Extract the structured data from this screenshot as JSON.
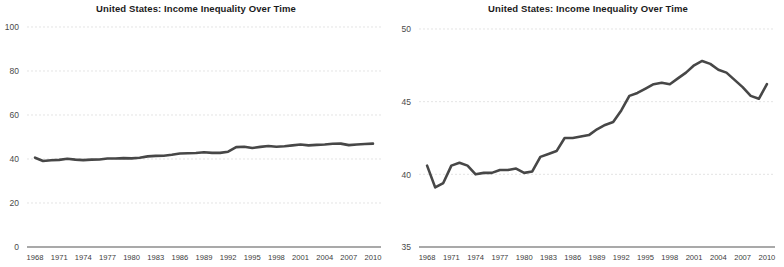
{
  "charts": [
    {
      "id": "left-chart",
      "title": "United States: Income Inequality Over Time",
      "y_ticks": [
        "0",
        "20",
        "40",
        "60",
        "80",
        "100"
      ],
      "x_ticks": [
        "1968",
        "1971",
        "1974",
        "1977",
        "1980",
        "1983",
        "1986",
        "1989",
        "1992",
        "1995",
        "1998",
        "2001",
        "2004",
        "2007",
        "2010"
      ],
      "line_color": "#474747",
      "grid_color": "#d8d8d8",
      "axis_color": "#555555"
    },
    {
      "id": "right-chart",
      "title": "United States: Income Inequality Over Time",
      "y_ticks": [
        "35",
        "40",
        "45",
        "50"
      ],
      "x_ticks": [
        "1968",
        "1971",
        "1974",
        "1977",
        "1980",
        "1983",
        "1986",
        "1989",
        "1992",
        "1995",
        "1998",
        "2001",
        "2004",
        "2007",
        "2010"
      ],
      "line_color": "#474747",
      "grid_color": "#d8d8d8",
      "axis_color": "#555555"
    }
  ],
  "chart_data": [
    {
      "type": "line",
      "title": "United States: Income Inequality Over Time",
      "xlabel": "",
      "ylabel": "",
      "ylim": [
        0,
        100
      ],
      "xlim": [
        1967,
        2011
      ],
      "yticks": [
        0,
        20,
        40,
        60,
        80,
        100
      ],
      "xticks": [
        1968,
        1971,
        1974,
        1977,
        1980,
        1983,
        1986,
        1989,
        1992,
        1995,
        1998,
        2001,
        2004,
        2007,
        2010
      ],
      "grid": true,
      "legend": "none",
      "series": [
        {
          "name": "Gini index",
          "x": [
            1968,
            1969,
            1970,
            1971,
            1972,
            1973,
            1974,
            1975,
            1976,
            1977,
            1978,
            1979,
            1980,
            1981,
            1982,
            1983,
            1984,
            1985,
            1986,
            1987,
            1988,
            1989,
            1990,
            1991,
            1992,
            1993,
            1994,
            1995,
            1996,
            1997,
            1998,
            1999,
            2000,
            2001,
            2002,
            2003,
            2004,
            2005,
            2006,
            2007,
            2008,
            2009,
            2010
          ],
          "values": [
            40.6,
            39.1,
            39.4,
            39.6,
            40.1,
            39.7,
            39.5,
            39.7,
            39.8,
            40.2,
            40.2,
            40.4,
            40.3,
            40.6,
            41.2,
            41.4,
            41.5,
            41.9,
            42.5,
            42.6,
            42.7,
            43.1,
            42.8,
            42.8,
            43.3,
            45.4,
            45.6,
            45.0,
            45.5,
            45.9,
            45.6,
            45.8,
            46.2,
            46.6,
            46.2,
            46.4,
            46.6,
            46.9,
            47.0,
            46.3,
            46.6,
            46.8,
            47.0
          ]
        }
      ]
    },
    {
      "type": "line",
      "title": "United States: Income Inequality Over Time",
      "xlabel": "",
      "ylabel": "",
      "ylim": [
        35,
        50
      ],
      "xlim": [
        1967,
        2011
      ],
      "yticks": [
        35,
        40,
        45,
        50
      ],
      "xticks": [
        1968,
        1971,
        1974,
        1977,
        1980,
        1983,
        1986,
        1989,
        1992,
        1995,
        1998,
        2001,
        2004,
        2007,
        2010
      ],
      "grid": true,
      "legend": "none",
      "series": [
        {
          "name": "Gini index",
          "x": [
            1968,
            1969,
            1970,
            1971,
            1972,
            1973,
            1974,
            1975,
            1976,
            1977,
            1978,
            1979,
            1980,
            1981,
            1982,
            1983,
            1984,
            1985,
            1986,
            1987,
            1988,
            1989,
            1990,
            1991,
            1992,
            1993,
            1994,
            1995,
            1996,
            1997,
            1998,
            1999,
            2000,
            2001,
            2002,
            2003,
            2004,
            2005,
            2006,
            2007,
            2008,
            2009,
            2010
          ],
          "values": [
            40.6,
            39.1,
            39.4,
            40.6,
            40.8,
            40.6,
            40.0,
            40.1,
            40.1,
            40.3,
            40.3,
            40.4,
            40.1,
            40.2,
            41.2,
            41.4,
            41.6,
            42.5,
            42.5,
            42.6,
            42.7,
            43.1,
            43.4,
            43.6,
            44.4,
            45.4,
            45.6,
            45.9,
            46.2,
            46.3,
            46.2,
            46.6,
            47.0,
            47.5,
            47.8,
            47.6,
            47.2,
            47.0,
            46.5,
            46.0,
            45.4,
            45.2,
            46.2
          ]
        }
      ]
    }
  ]
}
